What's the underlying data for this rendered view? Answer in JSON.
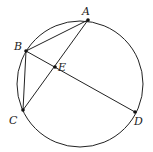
{
  "diagram": {
    "type": "circle-geometry",
    "circle": {
      "cx": 80,
      "cy": 84,
      "r": 63
    },
    "points": {
      "A": {
        "x": 88,
        "y": 20,
        "label": "A",
        "lx": 82,
        "ly": 15
      },
      "B": {
        "x": 26,
        "y": 51,
        "label": "B",
        "lx": 14,
        "ly": 50
      },
      "C": {
        "x": 23,
        "y": 110,
        "label": "C",
        "lx": 9,
        "ly": 124
      },
      "D": {
        "x": 135,
        "y": 112,
        "label": "D",
        "lx": 134,
        "ly": 125
      },
      "E": {
        "x": 55,
        "y": 67,
        "label": "E",
        "lx": 58,
        "ly": 71
      }
    },
    "segments": [
      [
        "A",
        "B"
      ],
      [
        "A",
        "C"
      ],
      [
        "B",
        "C"
      ],
      [
        "B",
        "D"
      ]
    ],
    "intersection": {
      "point": "E",
      "of": [
        [
          "A",
          "C"
        ],
        [
          "B",
          "D"
        ]
      ]
    }
  }
}
